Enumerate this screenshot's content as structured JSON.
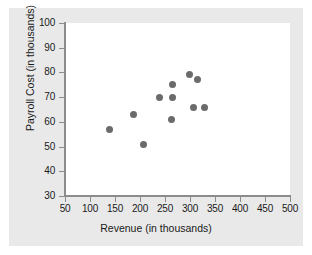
{
  "chart_data": {
    "type": "scatter",
    "title": "",
    "xlabel": "Revenue (in thousands)",
    "ylabel": "Payroll Cost (in thousands)",
    "xlim": [
      0,
      500
    ],
    "ylim": [
      30,
      100
    ],
    "xticks": [
      50,
      100,
      150,
      200,
      250,
      300,
      350,
      400,
      450,
      500
    ],
    "yticks": [
      30,
      40,
      50,
      60,
      70,
      80,
      90,
      100
    ],
    "xtick_labels": [
      "50",
      "100",
      "150",
      "200",
      "250",
      "300",
      "350",
      "400",
      "450",
      "500"
    ],
    "ytick_labels": [
      "30",
      "40",
      "50",
      "60",
      "70",
      "80",
      "90",
      "100"
    ],
    "grid": false,
    "legend": false,
    "marker": "circle",
    "marker_color": "#6b6b6b",
    "marker_size": 7,
    "points": [
      {
        "x": 138,
        "y": 57
      },
      {
        "x": 186,
        "y": 63
      },
      {
        "x": 206,
        "y": 51
      },
      {
        "x": 239,
        "y": 70
      },
      {
        "x": 263,
        "y": 61
      },
      {
        "x": 265,
        "y": 70
      },
      {
        "x": 265,
        "y": 75
      },
      {
        "x": 298,
        "y": 79
      },
      {
        "x": 307,
        "y": 66
      },
      {
        "x": 315,
        "y": 77
      },
      {
        "x": 329,
        "y": 66
      }
    ]
  },
  "figure": {
    "background_color": "#e9e9e9",
    "plot_background_color": "#ffffff",
    "axis_color": "#8c8c8c",
    "text_color": "#1a1a1a"
  }
}
